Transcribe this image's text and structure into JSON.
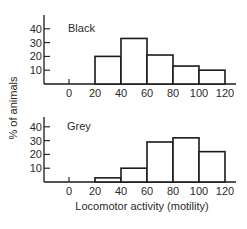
{
  "chart_data": [
    {
      "type": "bar",
      "title": "Black",
      "categories": [
        "20-40",
        "40-60",
        "60-80",
        "80-100",
        "100-120"
      ],
      "bin_edges": [
        20,
        40,
        60,
        80,
        100,
        120
      ],
      "values": [
        20,
        33,
        21,
        13,
        10
      ],
      "xlabel": "",
      "ylabel": "% of animals",
      "x_ticks": [
        "0",
        "20",
        "40",
        "60",
        "80",
        "100",
        "120"
      ],
      "y_ticks": [
        "10",
        "20",
        "30",
        "40"
      ],
      "ylim": [
        0,
        45
      ],
      "grid": false
    },
    {
      "type": "bar",
      "title": "Grey",
      "categories": [
        "20-40",
        "40-60",
        "60-80",
        "80-100",
        "100-120"
      ],
      "bin_edges": [
        20,
        40,
        60,
        80,
        100,
        120
      ],
      "values": [
        3,
        10,
        29,
        32,
        22
      ],
      "xlabel": "Locomotor activity (motility)",
      "ylabel": "% of animals",
      "x_ticks": [
        "0",
        "20",
        "40",
        "60",
        "80",
        "100",
        "120"
      ],
      "y_ticks": [
        "10",
        "20",
        "30",
        "40"
      ],
      "ylim": [
        0,
        45
      ],
      "grid": false
    }
  ],
  "labels": {
    "ylabel": "% of animals",
    "xlabel": "Locomotor activity (motility)",
    "top_title": "Black",
    "bottom_title": "Grey"
  }
}
